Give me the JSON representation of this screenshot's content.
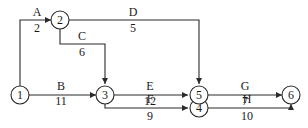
{
  "diagram": {
    "type": "activity-on-arrow network",
    "nodes": [
      {
        "id": "1",
        "label": "1"
      },
      {
        "id": "2",
        "label": "2"
      },
      {
        "id": "3",
        "label": "3"
      },
      {
        "id": "4",
        "label": "4"
      },
      {
        "id": "5",
        "label": "5"
      },
      {
        "id": "6",
        "label": "6"
      }
    ],
    "activities": [
      {
        "name": "A",
        "duration": "2",
        "from": "1",
        "to": "2"
      },
      {
        "name": "B",
        "duration": "11",
        "from": "1",
        "to": "3"
      },
      {
        "name": "C",
        "duration": "6",
        "from": "2",
        "to": "3"
      },
      {
        "name": "D",
        "duration": "5",
        "from": "2",
        "to": "5"
      },
      {
        "name": "E",
        "duration": "12",
        "from": "3",
        "to": "5"
      },
      {
        "name": "F",
        "duration": "9",
        "from": "3",
        "to": "4"
      },
      {
        "name": "G",
        "duration": "7",
        "from": "5",
        "to": "6"
      },
      {
        "name": "H",
        "duration": "10",
        "from": "4",
        "to": "6"
      }
    ],
    "dummies": [
      {
        "from": "4",
        "to": "5",
        "style": "dashed"
      }
    ]
  }
}
